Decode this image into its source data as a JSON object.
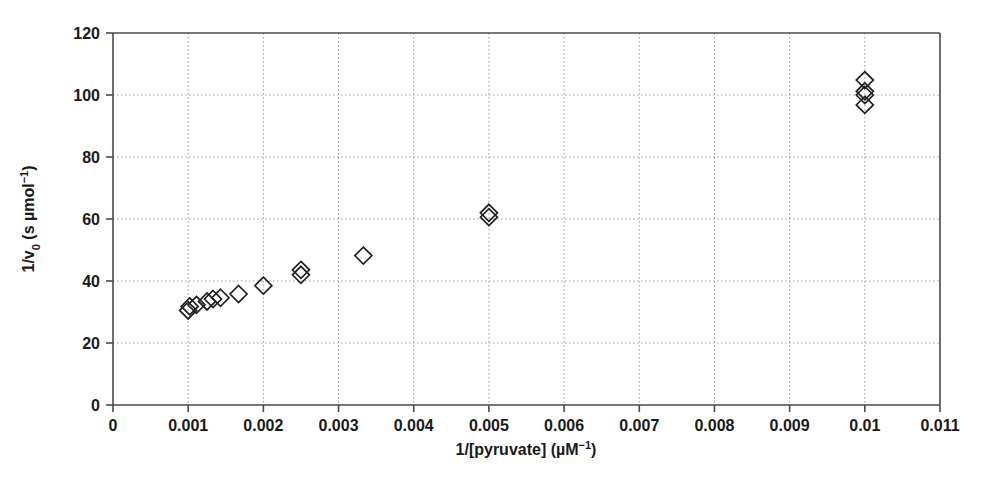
{
  "chart_data": {
    "type": "scatter",
    "title": "",
    "xlabel": "1/[pyruvate] (µM⁻¹)",
    "ylabel": "1/v₀ (s µmol⁻¹)",
    "xlim": [
      0,
      0.011
    ],
    "ylim": [
      0,
      120
    ],
    "grid": true,
    "legend": false,
    "marker": "open-diamond",
    "marker_color": "#222222",
    "xticks": [
      0,
      0.001,
      0.002,
      0.003,
      0.004,
      0.005,
      0.006,
      0.007,
      0.008,
      0.009,
      0.01,
      0.011
    ],
    "xtick_labels": [
      "0",
      "0.001",
      "0.002",
      "0.003",
      "0.004",
      "0.005",
      "0.006",
      "0.007",
      "0.008",
      "0.009",
      "0.01",
      "0.011"
    ],
    "yticks": [
      0,
      20,
      40,
      60,
      80,
      100,
      120
    ],
    "ytick_labels": [
      "0",
      "20",
      "40",
      "60",
      "80",
      "100",
      "120"
    ],
    "points": [
      {
        "x": 0.001,
        "y": 30.5
      },
      {
        "x": 0.00102,
        "y": 31.8
      },
      {
        "x": 0.00111,
        "y": 32.3
      },
      {
        "x": 0.00125,
        "y": 33.4
      },
      {
        "x": 0.00133,
        "y": 34.2
      },
      {
        "x": 0.00143,
        "y": 34.6
      },
      {
        "x": 0.00167,
        "y": 35.8
      },
      {
        "x": 0.002,
        "y": 38.5
      },
      {
        "x": 0.0025,
        "y": 42.0
      },
      {
        "x": 0.0025,
        "y": 43.6
      },
      {
        "x": 0.00333,
        "y": 48.2
      },
      {
        "x": 0.005,
        "y": 60.6
      },
      {
        "x": 0.005,
        "y": 62.0
      },
      {
        "x": 0.01,
        "y": 96.8
      },
      {
        "x": 0.01,
        "y": 100.0
      },
      {
        "x": 0.01,
        "y": 101.2
      },
      {
        "x": 0.01,
        "y": 104.8
      }
    ]
  },
  "axes": {
    "x_title_parts": {
      "main": "1/[pyruvate] (µM",
      "sup": "−1",
      "tail": ")"
    },
    "y_title_parts": {
      "lead": "1/v",
      "sub": "0",
      "mid": " (s µmol",
      "sup": "−1",
      "tail": ")"
    }
  },
  "colors": {
    "background": "#ffffff",
    "axis": "#4a4a4a",
    "grid": "#9a9a9a",
    "marker": "#222222",
    "text": "#1a1a1a"
  }
}
